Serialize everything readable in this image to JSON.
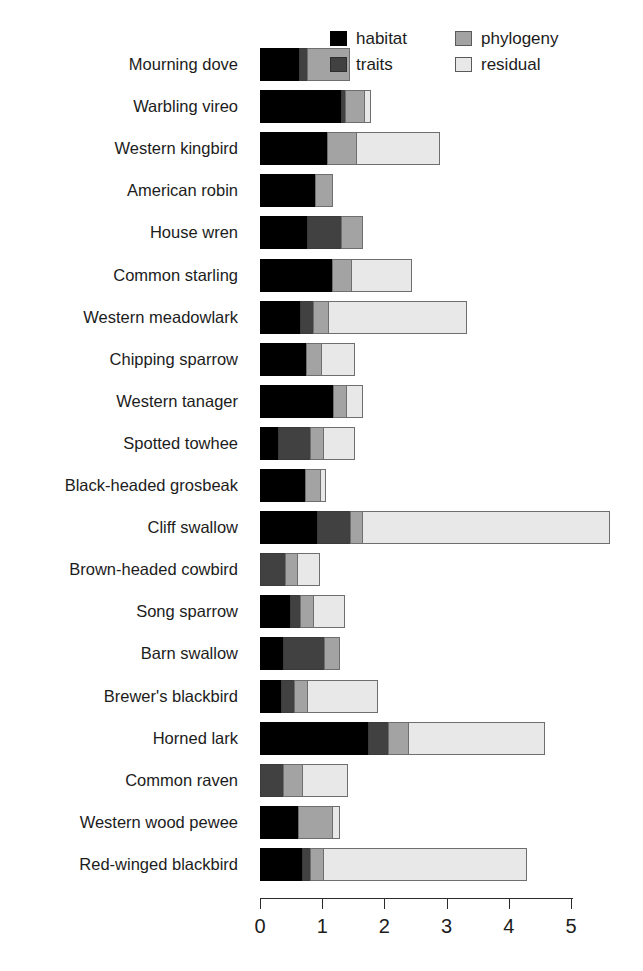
{
  "chart_data": {
    "type": "bar",
    "orientation": "horizontal",
    "stacked": true,
    "title": "",
    "xlabel": "",
    "ylabel": "",
    "xlim": [
      0,
      5
    ],
    "xticks": [
      "0",
      "1",
      "2",
      "3",
      "4",
      "5"
    ],
    "grid": false,
    "legend_position": "top-right",
    "series": [
      {
        "name": "habitat",
        "color": "#000000",
        "values": [
          0.62,
          1.3,
          1.08,
          0.88,
          0.76,
          1.16,
          0.64,
          0.74,
          1.17,
          0.29,
          0.72,
          0.92,
          0.0,
          0.48,
          0.37,
          0.34,
          1.74,
          0.0,
          0.61,
          0.68
        ]
      },
      {
        "name": "traits",
        "color": "#414141",
        "values": [
          0.13,
          0.07,
          0.0,
          0.0,
          0.55,
          0.0,
          0.21,
          0.0,
          0.0,
          0.51,
          0.0,
          0.53,
          0.4,
          0.16,
          0.66,
          0.21,
          0.32,
          0.37,
          0.0,
          0.13
        ]
      },
      {
        "name": "phylogeny",
        "color": "#a3a3a3",
        "values": [
          0.7,
          0.31,
          0.46,
          0.29,
          0.35,
          0.31,
          0.24,
          0.24,
          0.22,
          0.21,
          0.24,
          0.19,
          0.19,
          0.21,
          0.26,
          0.21,
          0.32,
          0.31,
          0.55,
          0.21
        ]
      },
      {
        "name": "residual",
        "color": "#e8e8e8",
        "values": [
          0.0,
          0.11,
          1.35,
          0.0,
          0.0,
          0.98,
          2.24,
          0.55,
          0.26,
          0.51,
          0.1,
          3.99,
          0.37,
          0.51,
          0.0,
          1.14,
          2.2,
          0.74,
          0.13,
          3.28
        ]
      }
    ],
    "categories": [
      "Mourning dove",
      "Warbling vireo",
      "Western kingbird",
      "American robin",
      "House wren",
      "Common starling",
      "Western meadowlark",
      "Chipping sparrow",
      "Western tanager",
      "Spotted towhee",
      "Black-headed grosbeak",
      "Cliff swallow",
      "Brown-headed cowbird",
      "Song sparrow",
      "Barn swallow",
      "Brewer's blackbird",
      "Horned lark",
      "Common raven",
      "Western wood pewee",
      "Red-winged blackbird"
    ],
    "totals": [
      1.45,
      1.79,
      2.89,
      1.17,
      1.66,
      2.45,
      3.33,
      1.53,
      1.65,
      1.52,
      1.06,
      5.63,
      0.96,
      1.36,
      1.29,
      1.9,
      4.58,
      1.42,
      1.29,
      4.3
    ]
  },
  "legend": {
    "items": [
      {
        "label": "habitat",
        "key": "habitat"
      },
      {
        "label": "traits",
        "key": "traits"
      },
      {
        "label": "phylogeny",
        "key": "phylogeny"
      },
      {
        "label": "residual",
        "key": "residual"
      }
    ]
  }
}
